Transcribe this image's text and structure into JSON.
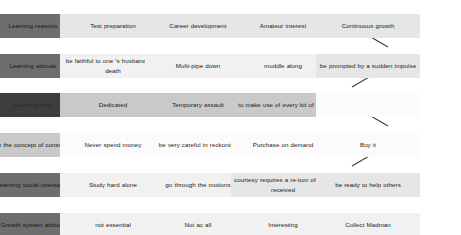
{
  "diagram": {
    "type": "matrix-grid",
    "rows": 6,
    "columns": 5,
    "row_labels_column": 1,
    "colors": {
      "label_dark": "#6e6e6e",
      "label_darkest": "#3d3d3d",
      "label_light": "#c9c9c9",
      "cell_light": "#e6e6e6",
      "cell_pale": "#f1f1f1",
      "cell_white": "#fbfbfb",
      "cell_mid": "#c9c9c9",
      "connector": "#3b3b3b",
      "page_background": "#ffffff"
    },
    "rows_data": [
      {
        "label": "Learning reasons",
        "label_shade": "label_dark",
        "cells": [
          {
            "text": "Test preparation",
            "shade": "cell_light"
          },
          {
            "text": "Career development",
            "shade": "cell_light"
          },
          {
            "text": "Amateur interest",
            "shade": "cell_light"
          },
          {
            "text": "Continuous growth",
            "shade": "cell_light"
          }
        ]
      },
      {
        "label": "Learning attitude",
        "label_shade": "label_dark",
        "cells": [
          {
            "text": "be faithful to one 's husband unto death",
            "shade": "cell_pale"
          },
          {
            "text": "Multi-pipe down",
            "shade": "cell_pale"
          },
          {
            "text": "muddle along",
            "shade": "cell_pale"
          },
          {
            "text": "be prompted by a sudden impulse",
            "shade": "cell_light"
          }
        ]
      },
      {
        "label": "Learning time",
        "label_shade": "label_darkest",
        "cells": [
          {
            "text": "Dedicated",
            "shade": "cell_mid"
          },
          {
            "text": "Temporary assault",
            "shade": "cell_mid"
          },
          {
            "text": "to make use of every bit of time",
            "shade": "cell_mid"
          },
          {
            "text": "",
            "shade": "cell_white"
          }
        ]
      },
      {
        "label": "Learn the concept of consumption",
        "label_shade": "label_light",
        "cells": [
          {
            "text": "Never spend money",
            "shade": "cell_white"
          },
          {
            "text": "be very careful in reckoning",
            "shade": "cell_white"
          },
          {
            "text": "Purchase on demand",
            "shade": "cell_white"
          },
          {
            "text": "Buy it",
            "shade": "cell_white"
          }
        ]
      },
      {
        "label": "Learning social orientation",
        "label_shade": "label_dark",
        "cells": [
          {
            "text": "Study hard alone",
            "shade": "cell_pale"
          },
          {
            "text": "go through the motions",
            "shade": "cell_pale"
          },
          {
            "text": "courtesy requires a re-tum of visits received",
            "shade": "cell_light"
          },
          {
            "text": "be ready to help others",
            "shade": "cell_light"
          }
        ]
      },
      {
        "label": "Growth system attitude",
        "label_shade": "label_dark",
        "cells": [
          {
            "text": "not essential",
            "shade": "cell_pale"
          },
          {
            "text": "Not ac all",
            "shade": "cell_pale"
          },
          {
            "text": "Interesting",
            "shade": "cell_pale"
          },
          {
            "text": "Collect Madman",
            "shade": "cell_pale"
          }
        ]
      }
    ],
    "connectors": [
      {
        "name": "amateur-interest-to-sudden-impulse",
        "x1": 352,
        "y1": 26,
        "x2": 388,
        "y2": 47
      },
      {
        "name": "sudden-impulse-to-every-bit-of-time",
        "x1": 388,
        "y1": 66,
        "x2": 352,
        "y2": 87
      },
      {
        "name": "every-bit-of-time-to-buy-it",
        "x1": 352,
        "y1": 105,
        "x2": 388,
        "y2": 126
      },
      {
        "name": "buy-it-to-be-ready-to-help",
        "x1": 388,
        "y1": 145,
        "x2": 352,
        "y2": 166
      },
      {
        "name": "courtesy-to-interesting",
        "x1": 329,
        "y1": 181,
        "x2": 329,
        "y2": 196
      }
    ]
  }
}
